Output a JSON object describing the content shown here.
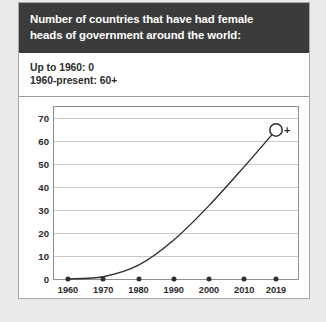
{
  "card": {
    "header": {
      "line1": "Number of countries that have had female",
      "line2": "heads of government around the world:",
      "background_color": "#3b3b3b",
      "text_color": "#ffffff"
    },
    "subtitle": {
      "line1": "Up to 1960: 0",
      "line2": "1960-present: 60+"
    },
    "background_color": "#ffffff",
    "border_color": "#a8a8a8"
  },
  "page": {
    "background_color": "#e9e9e9"
  },
  "chart_data": {
    "type": "line",
    "title": "Number of countries that have had female heads of government around the world:",
    "xlabel": "",
    "ylabel": "",
    "x": [
      1960,
      1970,
      1980,
      1990,
      2000,
      2010,
      2019
    ],
    "tick_labels": [
      "1960",
      "1970",
      "1980",
      "1990",
      "2000",
      "2010",
      "2019"
    ],
    "values": [
      0,
      1,
      6,
      17,
      32,
      49,
      65
    ],
    "endpoint_label": "+",
    "endpoint_marker": "open-circle",
    "ylim": [
      0,
      75
    ],
    "ytick_values": [
      0,
      10,
      20,
      30,
      40,
      50,
      60,
      70
    ],
    "ytick_labels": [
      "0",
      "10",
      "20",
      "30",
      "40",
      "50",
      "60",
      "70"
    ],
    "grid": true,
    "legend": "none",
    "line_color": "#2f2f2f",
    "marker_color": "#2f2f2f",
    "grid_color": "#c9c9c9",
    "baseline_markers": [
      0,
      0,
      0,
      0,
      0,
      0,
      0
    ]
  }
}
